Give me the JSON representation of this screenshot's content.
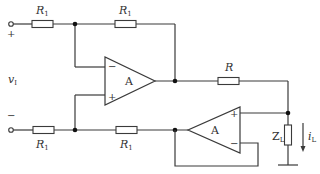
{
  "diagram": {
    "type": "circuit-schematic",
    "title": "",
    "input": {
      "label": "v",
      "subscript": "I",
      "plus_sign": "+",
      "minus_sign": "−"
    },
    "resistors": {
      "r1_top_left": {
        "label": "R",
        "subscript": "1"
      },
      "r1_top_right": {
        "label": "R",
        "subscript": "1"
      },
      "r1_bottom_left": {
        "label": "R",
        "subscript": "1"
      },
      "r1_bottom_right": {
        "label": "R",
        "subscript": "1"
      },
      "r_output": {
        "label": "R",
        "subscript": ""
      }
    },
    "opamps": [
      {
        "id": "amp1",
        "label": "A",
        "inv_sign": "−",
        "noninv_sign": "+"
      },
      {
        "id": "amp2",
        "label": "A",
        "inv_sign": "−",
        "noninv_sign": "+"
      }
    ],
    "load": {
      "label": "Z",
      "subscript": "L"
    },
    "current": {
      "label": "i",
      "subscript": "L"
    },
    "colors": {
      "line": "#3a3a3a",
      "node": "#111111",
      "background": "#ffffff"
    }
  }
}
